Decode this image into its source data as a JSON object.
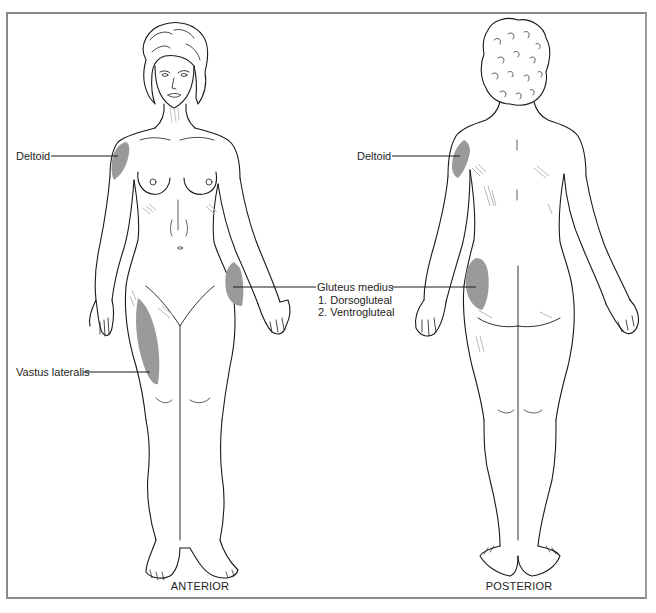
{
  "figure": {
    "views": [
      {
        "id": "anterior",
        "caption": "ANTERIOR"
      },
      {
        "id": "posterior",
        "caption": "POSTERIOR"
      }
    ],
    "labels": {
      "anterior_deltoid": "Deltoid",
      "posterior_deltoid": "Deltoid",
      "gluteus_medius": "Gluteus medius",
      "gluteus_sub": [
        "1. Dorsogluteal",
        "2. Ventrogluteal"
      ],
      "vastus_lateralis": "Vastus lateralis"
    },
    "colors": {
      "injection_site_fill": "#9a9a9a",
      "outline": "#1a1a1a",
      "frame": "#8a8a8a",
      "hatch": "#b5b5b5"
    }
  }
}
